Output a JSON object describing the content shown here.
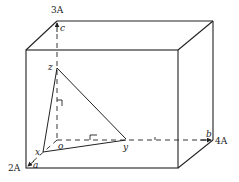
{
  "diagram": {
    "type": "3d-box-with-triangle",
    "stroke_color": "#222222",
    "background": "#ffffff",
    "labels": {
      "top_axis": "3A",
      "left_axis": "2A",
      "right_axis": "4A",
      "c": "c",
      "b": "b",
      "a": "a",
      "o": "o",
      "x": "x",
      "y": "y",
      "z": "z"
    }
  }
}
